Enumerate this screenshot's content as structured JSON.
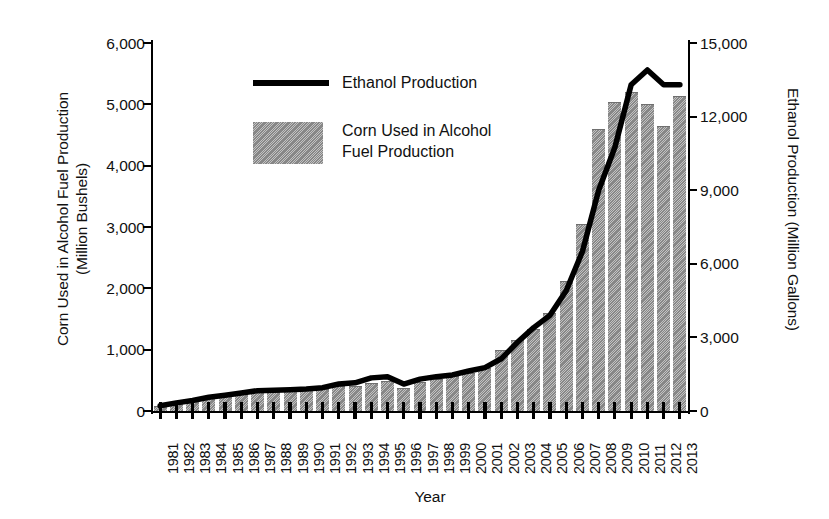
{
  "chart_data": {
    "type": "bar",
    "title": "",
    "xlabel": "Year",
    "ylabel": "Corn Used in Alcohol Fuel Production\n(Million Bushels)",
    "ylabel_right": "Ethanol Production (Million Gallons)",
    "grid": false,
    "legend_position": "upper-left-inside",
    "ylim": [
      0,
      6000
    ],
    "ylim_right": [
      0,
      15000
    ],
    "yticks": [
      "0",
      "1,000",
      "2,000",
      "3,000",
      "4,000",
      "5,000",
      "6,000"
    ],
    "ytick_values": [
      0,
      1000,
      2000,
      3000,
      4000,
      5000,
      6000
    ],
    "yticks_right": [
      "0",
      "3,000",
      "6,000",
      "9,000",
      "12,000",
      "15,000"
    ],
    "ytick_values_right": [
      0,
      3000,
      6000,
      9000,
      12000,
      15000
    ],
    "categories": [
      "1981",
      "1982",
      "1983",
      "1984",
      "1985",
      "1986",
      "1987",
      "1988",
      "1989",
      "1990",
      "1991",
      "1992",
      "1993",
      "1994",
      "1995",
      "1996",
      "1997",
      "1998",
      "1999",
      "2000",
      "2001",
      "2002",
      "2003",
      "2004",
      "2005",
      "2006",
      "2007",
      "2008",
      "2009",
      "2010",
      "2011",
      "2012",
      "2013"
    ],
    "series": [
      {
        "name": "Corn Used in Alcohol Fuel Production",
        "axis": "left",
        "unit": "Million Bushels",
        "style": "bar",
        "color": "#9a9a9a",
        "values": [
          85,
          125,
          170,
          210,
          245,
          280,
          305,
          315,
          325,
          340,
          360,
          400,
          415,
          460,
          485,
          370,
          480,
          520,
          570,
          615,
          705,
          995,
          1165,
          1335,
          1600,
          2120,
          3050,
          4600,
          5040,
          5200,
          5010,
          4650,
          5140
        ]
      },
      {
        "name": "Ethanol Production",
        "axis": "right",
        "unit": "Million Gallons",
        "style": "line",
        "color": "#000000",
        "values": [
          215,
          330,
          430,
          560,
          640,
          730,
          830,
          845,
          870,
          900,
          950,
          1100,
          1150,
          1350,
          1400,
          1100,
          1300,
          1400,
          1470,
          1630,
          1770,
          2130,
          2800,
          3400,
          3900,
          4900,
          6500,
          9000,
          10750,
          13300,
          13900,
          13300,
          13300
        ]
      }
    ]
  },
  "legend": {
    "line_label": "Ethanol Production",
    "bar_label": "Corn Used in Alcohol\nFuel Production"
  }
}
